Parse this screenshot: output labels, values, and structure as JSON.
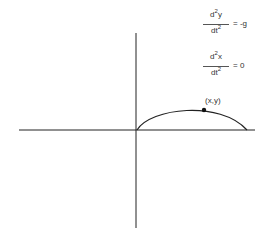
{
  "equations": [
    {
      "num_d": "d",
      "num_exp": "2",
      "num_var": "y",
      "den_d": "dt",
      "den_exp": "2",
      "rhs": "= -g"
    },
    {
      "num_d": "d",
      "num_exp": "2",
      "num_var": "x",
      "den_d": "dt",
      "den_exp": "2",
      "rhs": "= 0"
    }
  ],
  "point_label": "(x,y)",
  "diagram": {
    "type": "projectile-trajectory",
    "axes": {
      "origin": [
        136,
        130
      ],
      "x_range": [
        19,
        255
      ],
      "y_range": [
        33,
        228
      ]
    },
    "curve": {
      "start": [
        137,
        130
      ],
      "peak": [
        186,
        109
      ],
      "end": [
        247,
        130
      ]
    },
    "marker": [
      204,
      110
    ],
    "colors": {
      "stroke": "#222222",
      "background": "#ffffff"
    }
  }
}
